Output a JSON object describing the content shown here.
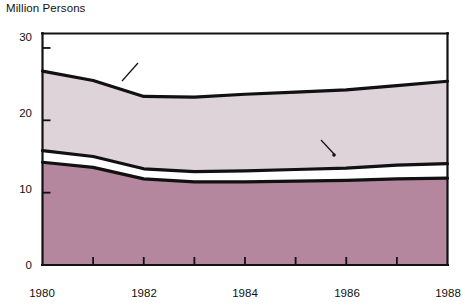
{
  "chart_data": {
    "type": "area",
    "title": "",
    "ylabel": "Million Persons",
    "xlabel": "",
    "xlim": [
      1980,
      1988
    ],
    "ylim": [
      0,
      32
    ],
    "grid": false,
    "legend_position": "inline-annotations",
    "stacked": true,
    "x": [
      1980,
      1981,
      1982,
      1983,
      1984,
      1985,
      1986,
      1987,
      1988
    ],
    "y_ticks": [
      0,
      10,
      20,
      30
    ],
    "y_tick_labels": [
      "0",
      "10",
      "20",
      "30"
    ],
    "x_ticks": [
      1980,
      1981,
      1982,
      1983,
      1984,
      1985,
      1986,
      1987,
      1988
    ],
    "x_tick_labels": [
      "1980",
      "",
      "1982",
      "",
      "1984",
      "",
      "1986",
      "",
      "1988"
    ],
    "x_labeled": [
      "1980",
      "1982",
      "1984",
      "1986",
      "1988"
    ],
    "series": [
      {
        "name": "Full Price",
        "color": "#b5879e",
        "values": [
          14.2,
          13.5,
          11.9,
          11.5,
          11.5,
          11.6,
          11.7,
          11.9,
          12.0
        ]
      },
      {
        "name": "Reduced Price",
        "color": "#ded3d8",
        "values": [
          1.6,
          1.5,
          1.4,
          1.4,
          1.5,
          1.6,
          1.7,
          1.9,
          2.0
        ],
        "cumulative": [
          15.8,
          15.0,
          13.3,
          12.9,
          13.0,
          13.2,
          13.4,
          13.8,
          14.0
        ]
      },
      {
        "name": "Free",
        "color": "#ded3d8",
        "values": [
          11.0,
          10.5,
          10.0,
          10.3,
          10.6,
          10.7,
          10.8,
          11.0,
          11.4
        ],
        "cumulative": [
          26.8,
          25.5,
          23.3,
          23.2,
          23.6,
          23.9,
          24.2,
          24.8,
          25.4
        ]
      }
    ],
    "total": {
      "name": "Total",
      "values": [
        26.8,
        25.5,
        23.3,
        23.2,
        23.6,
        23.9,
        24.2,
        24.8,
        25.4
      ]
    },
    "annotations": [
      {
        "text": "Total",
        "kind": "leader-label"
      },
      {
        "text": "Free",
        "kind": "area-label"
      },
      {
        "text": "Reduced Price",
        "kind": "leader-label"
      },
      {
        "text": "Full Price",
        "kind": "area-label"
      }
    ]
  },
  "labels": {
    "y_axis_title": "Million Persons",
    "total": "Total",
    "free": "Free",
    "reduced_price": "Reduced Price",
    "full_price": "Full Price"
  },
  "ticks": {
    "y": [
      {
        "value": "30"
      },
      {
        "value": "20"
      },
      {
        "value": "10"
      },
      {
        "value": "0"
      }
    ],
    "x": [
      {
        "value": "1980"
      },
      {
        "value": "1982"
      },
      {
        "value": "1984"
      },
      {
        "value": "1986"
      },
      {
        "value": "1988"
      }
    ]
  },
  "colors": {
    "full_price_fill": "#b5879e",
    "free_fill": "#ded3d8",
    "line": "#111111",
    "axis": "#111111",
    "background": "#ffffff"
  }
}
